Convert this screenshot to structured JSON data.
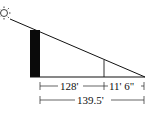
{
  "diagram": {
    "type": "shadow-similar-triangles",
    "icons": {
      "sun": "sun-icon"
    },
    "labels": {
      "segment_left": "128'",
      "segment_right": "11' 6\"",
      "total": "139.5'"
    },
    "colors": {
      "line": "#111111",
      "building": "#0a0a0a",
      "background": "#ffffff"
    }
  }
}
